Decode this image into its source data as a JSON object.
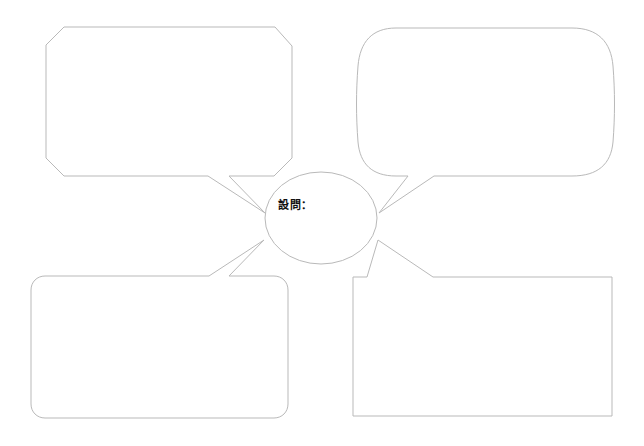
{
  "worksheet": {
    "title": "設問ワークシート",
    "width": 644,
    "height": 446,
    "background_color": "#ffffff",
    "line_color": "#b9b9b9",
    "text_color": "#111111"
  },
  "hub": {
    "name": "question-hub",
    "label": "設問：",
    "value": "",
    "shape": "circle",
    "center_x": 321,
    "center_y": 218,
    "radius_x": 56,
    "radius_y": 46
  },
  "balloons": [
    {
      "id": "top-left",
      "name": "answer-balloon-top-left",
      "shape": "octagon",
      "tail_direction": "down-right",
      "value": "",
      "placeholder": ""
    },
    {
      "id": "top-right",
      "name": "answer-balloon-top-right",
      "shape": "oval-rounded",
      "tail_direction": "down-left",
      "value": "",
      "placeholder": ""
    },
    {
      "id": "bottom-left",
      "name": "answer-balloon-bottom-left",
      "shape": "rounded-rectangle",
      "tail_direction": "up-right",
      "value": "",
      "placeholder": ""
    },
    {
      "id": "bottom-right",
      "name": "answer-balloon-bottom-right",
      "shape": "rectangle",
      "tail_direction": "up-left",
      "value": "",
      "placeholder": ""
    }
  ]
}
